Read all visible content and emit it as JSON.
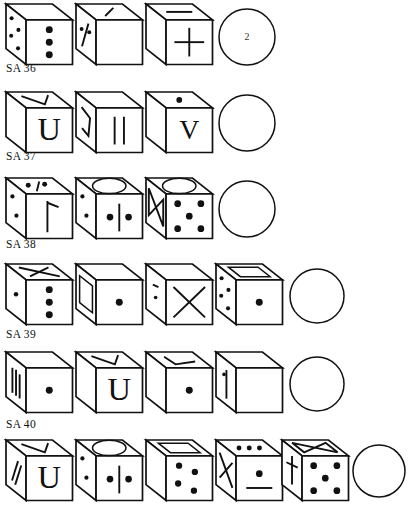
{
  "page": {
    "document_type": "test-worksheet",
    "background": "#ffffff",
    "ink_color": "#111111",
    "width": 408,
    "height": 511
  },
  "items": [
    {
      "id": "item-sa-36",
      "label": "SA 36",
      "label_x": 6,
      "label_y": 62,
      "row_top": 2,
      "figures": [
        {
          "name": "cube-1",
          "x": 6,
          "y": 4,
          "w": 68,
          "h": 62,
          "kind": "cube",
          "top_face": "blank",
          "left_face": "four-dots",
          "front_face": "three-dots-vertical"
        },
        {
          "name": "cube-2",
          "x": 76,
          "y": 4,
          "w": 68,
          "h": 62,
          "kind": "cube",
          "top_face": "diagonal-stroke",
          "left_face": "two-dots-and-slash",
          "front_face": "blank"
        },
        {
          "name": "cube-3",
          "x": 146,
          "y": 4,
          "w": 68,
          "h": 62,
          "kind": "cube",
          "top_face": "horizontal-dash",
          "left_face": "blank",
          "front_face": "plus-sign"
        },
        {
          "name": "answer-circle",
          "x": 216,
          "y": 8,
          "w": 62,
          "h": 58,
          "kind": "circle",
          "answer": "2"
        }
      ]
    },
    {
      "id": "item-sa-37",
      "label": "SA 37",
      "label_x": 6,
      "label_y": 150,
      "row_top": 90,
      "figures": [
        {
          "name": "cube-1",
          "x": 6,
          "y": 92,
          "w": 68,
          "h": 62,
          "kind": "cube",
          "top_face": "check-mark",
          "left_face": "blank",
          "front_face": "letter-U"
        },
        {
          "name": "cube-2",
          "x": 76,
          "y": 92,
          "w": 68,
          "h": 62,
          "kind": "cube",
          "top_face": "blank",
          "left_face": "hook-stroke",
          "front_face": "double-vertical-bars"
        },
        {
          "name": "cube-3",
          "x": 146,
          "y": 92,
          "w": 68,
          "h": 62,
          "kind": "cube",
          "top_face": "single-dot",
          "left_face": "blank",
          "front_face": "letter-V"
        },
        {
          "name": "answer-circle",
          "x": 216,
          "y": 94,
          "w": 62,
          "h": 58,
          "kind": "circle",
          "answer": ""
        }
      ]
    },
    {
      "id": "item-sa-38",
      "label": "SA 38",
      "label_x": 6,
      "label_y": 238,
      "row_top": 176,
      "figures": [
        {
          "name": "cube-1",
          "x": 6,
          "y": 178,
          "w": 68,
          "h": 62,
          "kind": "cube",
          "top_face": "two-dots-and-slash",
          "left_face": "two-dots",
          "front_face": "flag-tick-symbol"
        },
        {
          "name": "cube-2",
          "x": 76,
          "y": 178,
          "w": 68,
          "h": 62,
          "kind": "cube",
          "top_face": "ellipse",
          "left_face": "two-dots",
          "front_face": "two-dots-with-bar"
        },
        {
          "name": "cube-3",
          "x": 146,
          "y": 178,
          "w": 68,
          "h": 62,
          "kind": "cube",
          "top_face": "ellipse",
          "left_face": "bowtie",
          "front_face": "five-dots"
        },
        {
          "name": "answer-circle",
          "x": 216,
          "y": 180,
          "w": 62,
          "h": 58,
          "kind": "circle",
          "answer": ""
        }
      ]
    },
    {
      "id": "item-sa-39",
      "label": "SA 39",
      "label_x": 6,
      "label_y": 328,
      "row_top": 262,
      "figures": [
        {
          "name": "cube-1",
          "x": 6,
          "y": 264,
          "w": 68,
          "h": 62,
          "kind": "cube",
          "top_face": "cross-x",
          "left_face": "single-dot",
          "front_face": "three-dots-vertical"
        },
        {
          "name": "cube-2",
          "x": 76,
          "y": 264,
          "w": 68,
          "h": 62,
          "kind": "cube",
          "top_face": "blank",
          "left_face": "rectangle-outline",
          "front_face": "single-dot"
        },
        {
          "name": "cube-3",
          "x": 146,
          "y": 264,
          "w": 68,
          "h": 62,
          "kind": "cube",
          "top_face": "blank",
          "left_face": "dot-and-dash",
          "front_face": "large-X"
        },
        {
          "name": "cube-4",
          "x": 216,
          "y": 264,
          "w": 68,
          "h": 62,
          "kind": "cube",
          "top_face": "rectangle-outline",
          "left_face": "four-dots",
          "front_face": "single-dot"
        },
        {
          "name": "answer-circle",
          "x": 288,
          "y": 268,
          "w": 58,
          "h": 56,
          "kind": "circle",
          "answer": ""
        }
      ]
    },
    {
      "id": "item-sa-40",
      "label": "SA 40",
      "label_x": 6,
      "label_y": 418,
      "row_top": 350,
      "figures": [
        {
          "name": "cube-1",
          "x": 6,
          "y": 352,
          "w": 68,
          "h": 62,
          "kind": "cube",
          "top_face": "blank",
          "left_face": "three-vertical-bars",
          "front_face": "single-dot"
        },
        {
          "name": "cube-2",
          "x": 76,
          "y": 352,
          "w": 68,
          "h": 62,
          "kind": "cube",
          "top_face": "check-mark",
          "left_face": "blank",
          "front_face": "letter-U"
        },
        {
          "name": "cube-3",
          "x": 146,
          "y": 352,
          "w": 68,
          "h": 62,
          "kind": "cube",
          "top_face": "angle-mark",
          "left_face": "blank",
          "front_face": "single-dot"
        },
        {
          "name": "cube-4",
          "x": 216,
          "y": 352,
          "w": 68,
          "h": 62,
          "kind": "cube",
          "top_face": "blank",
          "left_face": "dot-and-vertical-bar",
          "front_face": "blank"
        },
        {
          "name": "answer-circle",
          "x": 288,
          "y": 356,
          "w": 58,
          "h": 56,
          "kind": "circle",
          "answer": ""
        }
      ]
    },
    {
      "id": "item-partial-bottom",
      "label": "",
      "label_x": 0,
      "label_y": 0,
      "row_top": 438,
      "figures": [
        {
          "name": "cube-1",
          "x": 6,
          "y": 440,
          "w": 68,
          "h": 62,
          "kind": "cube",
          "top_face": "check-mark",
          "left_face": "double-slash",
          "front_face": "letter-U"
        },
        {
          "name": "cube-2",
          "x": 76,
          "y": 440,
          "w": 68,
          "h": 62,
          "kind": "cube",
          "top_face": "ellipse",
          "left_face": "two-dots",
          "front_face": "two-dots-with-bar"
        },
        {
          "name": "cube-3",
          "x": 146,
          "y": 440,
          "w": 68,
          "h": 62,
          "kind": "cube",
          "top_face": "rectangle-outline",
          "left_face": "blank",
          "front_face": "four-dots"
        },
        {
          "name": "cube-4",
          "x": 216,
          "y": 440,
          "w": 68,
          "h": 62,
          "kind": "cube",
          "top_face": "three-dots-horizontal",
          "left_face": "cross-x",
          "front_face": "dot-over-line"
        },
        {
          "name": "cube-5",
          "x": 282,
          "y": 440,
          "w": 68,
          "h": 62,
          "kind": "cube",
          "top_face": "bowtie",
          "left_face": "cross-stroke",
          "front_face": "five-dots"
        },
        {
          "name": "answer-circle",
          "x": 352,
          "y": 444,
          "w": 54,
          "h": 54,
          "kind": "circle",
          "answer": ""
        }
      ]
    }
  ]
}
